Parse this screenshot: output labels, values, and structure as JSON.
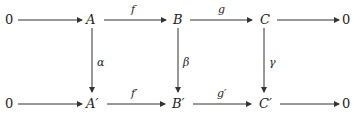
{
  "diagram": {
    "type": "commutative-diagram",
    "top_row": [
      "0",
      "A",
      "B",
      "C",
      "0"
    ],
    "bottom_row": [
      "0",
      "A′",
      "B′",
      "C′",
      "0"
    ],
    "top_arrows": [
      "",
      "f",
      "g",
      ""
    ],
    "bottom_arrows": [
      "",
      "f′",
      "g′",
      ""
    ],
    "vertical_arrows": [
      "α",
      "β",
      "γ"
    ]
  }
}
